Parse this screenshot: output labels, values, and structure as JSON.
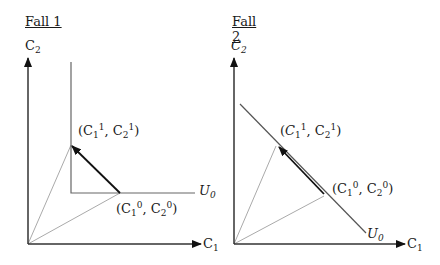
{
  "panels": [
    {
      "title": "Fall 1",
      "y_axis_label": {
        "base": "C",
        "sub": "2"
      },
      "x_axis_label": {
        "base": "C",
        "sub": "1"
      },
      "curve_label": {
        "base": "U",
        "sub": "0"
      },
      "curve_type": "L-shaped (perfect complements)",
      "point_new": {
        "open": "(",
        "b1": "C",
        "s1": "1",
        "p1": "1",
        "sep": ",",
        "b2": "C",
        "s2": "2",
        "p2": "1",
        "close": ")"
      },
      "point_old": {
        "open": "(",
        "b1": "C",
        "s1": "1",
        "p1": "0",
        "sep": ",",
        "b2": "C",
        "s2": "2",
        "p2": "0",
        "close": ")"
      }
    },
    {
      "title": "Fall 2",
      "y_axis_label": {
        "base": "C",
        "sub": "2"
      },
      "x_axis_label": {
        "base": "C",
        "sub": "1"
      },
      "curve_label": {
        "base": "U",
        "sub": "0"
      },
      "curve_type": "straight line (perfect substitutes)",
      "point_new": {
        "open": "(",
        "b1": "C",
        "s1": "1",
        "p1": "1",
        "sep": ",",
        "b2": "C",
        "s2": "2",
        "p2": "1",
        "close": ")"
      },
      "point_old": {
        "open": "(",
        "b1": "C",
        "s1": "1",
        "p1": "0",
        "sep": ",",
        "b2": "C",
        "s2": "2",
        "p2": "0",
        "close": ")"
      }
    }
  ],
  "colors": {
    "axis": "#1a1a1a",
    "curve": "#555555",
    "ray": "#999999",
    "arrow": "#111111"
  }
}
